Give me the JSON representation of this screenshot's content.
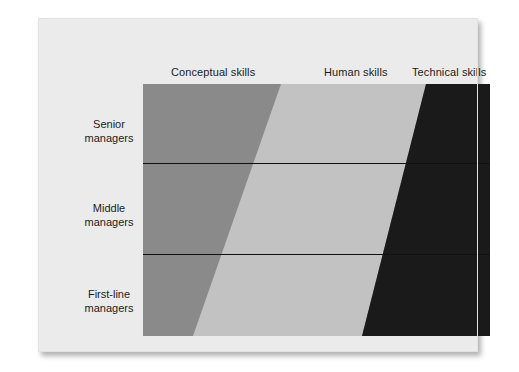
{
  "figure": {
    "background_color": "#ebebeb",
    "page_background": "#ffffff"
  },
  "columns": [
    {
      "label": "Conceptual skills",
      "color": "#8a8a8a"
    },
    {
      "label": "Human skills",
      "color": "#c2c2c2"
    },
    {
      "label": "Technical skills",
      "color": "#1a1a1a"
    }
  ],
  "rows": [
    {
      "line1": "Senior",
      "line2": "managers"
    },
    {
      "line1": "Middle",
      "line2": "managers"
    },
    {
      "line1": "First-line",
      "line2": "managers"
    }
  ],
  "chart_data": {
    "type": "area",
    "title": "",
    "subtitle": "",
    "xlabel": "",
    "ylabel": "",
    "grid": false,
    "legend_position": "top",
    "categories": [
      "Senior managers",
      "Middle managers",
      "First-line managers"
    ],
    "series": [
      {
        "name": "Conceptual skills",
        "color": "#8a8a8a",
        "values": [
          40,
          28,
          14
        ]
      },
      {
        "name": "Human skills",
        "color": "#c2c2c2",
        "values": [
          42,
          44,
          49
        ]
      },
      {
        "name": "Technical skills",
        "color": "#1a1a1a",
        "values": [
          18,
          28,
          37
        ]
      }
    ],
    "axis_note": "Horizontal proportion of each skill type per management level; bands separated by straight diagonal boundaries.",
    "boundaries": {
      "conceptual_human": {
        "top_percent": 40,
        "bottom_percent": 14
      },
      "human_technical": {
        "top_percent": 82,
        "bottom_percent": 63
      }
    },
    "xlim": [
      0,
      100
    ],
    "ylim": [
      0,
      3
    ]
  },
  "geometry": {
    "plot_left": 105,
    "plot_top": 66,
    "plot_width": 347,
    "plot_height": 252,
    "divider_y": [
      145,
      236
    ],
    "diagonal1_top_x": 243,
    "diagonal1_bottom_x": 155,
    "diagonal2_top_x": 388,
    "diagonal2_bottom_x": 324
  }
}
